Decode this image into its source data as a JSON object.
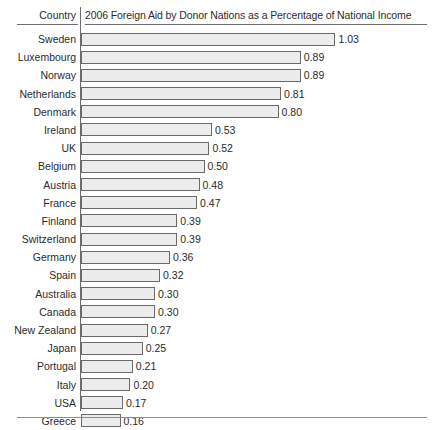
{
  "header": {
    "country_label": "Country",
    "title": "2006 Foreign Aid by Donor Nations as a Percentage of National Income"
  },
  "chart_data": {
    "type": "bar",
    "orientation": "horizontal",
    "title": "2006 Foreign Aid by Donor Nations as a Percentage of National Income",
    "xlabel": "",
    "ylabel": "Country",
    "xlim": [
      0,
      1.03
    ],
    "grid": false,
    "legend": false,
    "categories": [
      "Sweden",
      "Luxembourg",
      "Norway",
      "Netherlands",
      "Denmark",
      "Ireland",
      "UK",
      "Belgium",
      "Austria",
      "France",
      "Finland",
      "Switzerland",
      "Germany",
      "Spain",
      "Australia",
      "Canada",
      "New Zealand",
      "Japan",
      "Portugal",
      "Italy",
      "USA",
      "Greece"
    ],
    "values": [
      1.03,
      0.89,
      0.89,
      0.81,
      0.8,
      0.53,
      0.52,
      0.5,
      0.48,
      0.47,
      0.39,
      0.39,
      0.36,
      0.32,
      0.3,
      0.3,
      0.27,
      0.25,
      0.21,
      0.2,
      0.17,
      0.16
    ],
    "value_labels": [
      "1.03",
      "0.89",
      "0.89",
      "0.81",
      "0.80",
      "0.53",
      "0.52",
      "0.50",
      "0.48",
      "0.47",
      "0.39",
      "0.39",
      "0.36",
      "0.32",
      "0.30",
      "0.30",
      "0.27",
      "0.25",
      "0.21",
      "0.20",
      "0.17",
      "0.16"
    ]
  },
  "style": {
    "bar_fill": "#ececec",
    "bar_border": "#6a6a6a",
    "text_color": "#2b2b2b",
    "rule_color": "#6e6e6e",
    "background": "#ffffff"
  }
}
